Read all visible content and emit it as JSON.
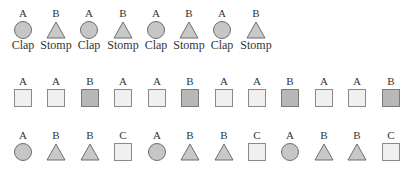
{
  "colors": {
    "circle_fill": "#c6c6c6",
    "triangle_fill": "#c8c8c8",
    "square_light": "#f0f0f0",
    "square_dark": "#b8b8b8",
    "stroke": "#6e6e6e"
  },
  "rows": [
    {
      "name": "clap-stomp-pattern",
      "items": [
        {
          "label": "A",
          "shape": "circle",
          "caption": "Clap"
        },
        {
          "label": "B",
          "shape": "triangle",
          "caption": "Stomp"
        },
        {
          "label": "A",
          "shape": "circle",
          "caption": "Clap"
        },
        {
          "label": "B",
          "shape": "triangle",
          "caption": "Stomp"
        },
        {
          "label": "A",
          "shape": "circle",
          "caption": "Clap"
        },
        {
          "label": "B",
          "shape": "triangle",
          "caption": "Stomp"
        },
        {
          "label": "A",
          "shape": "circle",
          "caption": "Clap"
        },
        {
          "label": "B",
          "shape": "triangle",
          "caption": "Stomp"
        }
      ]
    },
    {
      "name": "aab-square-pattern",
      "items": [
        {
          "label": "A",
          "shape": "square-light"
        },
        {
          "label": "A",
          "shape": "square-light"
        },
        {
          "label": "B",
          "shape": "square-dark"
        },
        {
          "label": "A",
          "shape": "square-light"
        },
        {
          "label": "A",
          "shape": "square-light"
        },
        {
          "label": "B",
          "shape": "square-dark"
        },
        {
          "label": "A",
          "shape": "square-light"
        },
        {
          "label": "A",
          "shape": "square-light"
        },
        {
          "label": "B",
          "shape": "square-dark"
        },
        {
          "label": "A",
          "shape": "square-light"
        },
        {
          "label": "A",
          "shape": "square-light"
        },
        {
          "label": "B",
          "shape": "square-dark"
        }
      ]
    },
    {
      "name": "abbc-mixed-pattern",
      "items": [
        {
          "label": "A",
          "shape": "circle"
        },
        {
          "label": "B",
          "shape": "triangle"
        },
        {
          "label": "B",
          "shape": "triangle"
        },
        {
          "label": "C",
          "shape": "square-light"
        },
        {
          "label": "A",
          "shape": "circle"
        },
        {
          "label": "B",
          "shape": "triangle"
        },
        {
          "label": "B",
          "shape": "triangle"
        },
        {
          "label": "C",
          "shape": "square-light"
        },
        {
          "label": "A",
          "shape": "circle"
        },
        {
          "label": "B",
          "shape": "triangle"
        },
        {
          "label": "B",
          "shape": "triangle"
        },
        {
          "label": "C",
          "shape": "square-light"
        }
      ]
    }
  ]
}
